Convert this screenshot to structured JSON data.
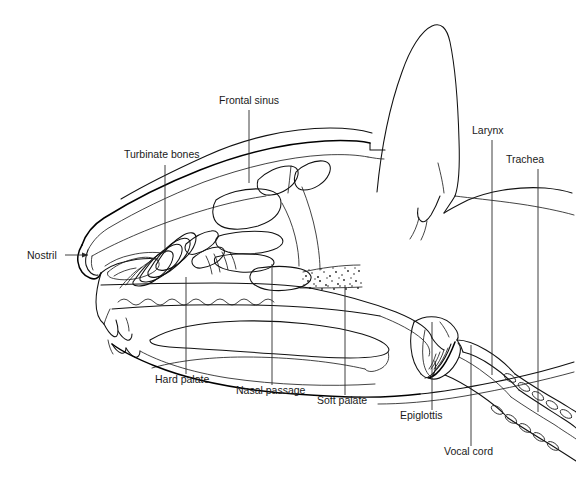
{
  "figure": {
    "type": "anatomical-line-diagram",
    "background_color": "#ffffff",
    "line_color": "#111111",
    "text_color": "#1a1a1a",
    "width": 576,
    "height": 484
  },
  "labels": [
    {
      "id": "frontal-sinus",
      "text": "Frontal sinus",
      "text_x": 219,
      "text_y": 104,
      "anchor": "start",
      "leader": {
        "type": "vertical",
        "x": 249,
        "y1": 110,
        "y2": 183
      }
    },
    {
      "id": "turbinate-bones",
      "text": "Turbinate bones",
      "text_x": 124,
      "text_y": 158,
      "anchor": "start",
      "leader": {
        "type": "vertical",
        "x": 165,
        "y1": 165,
        "y2": 253
      }
    },
    {
      "id": "larynx",
      "text": "Larynx",
      "text_x": 472,
      "text_y": 134,
      "anchor": "start",
      "leader": {
        "type": "vertical",
        "x": 492,
        "y1": 140,
        "y2": 375
      }
    },
    {
      "id": "trachea",
      "text": "Trachea",
      "text_x": 506,
      "text_y": 163,
      "anchor": "start",
      "leader": {
        "type": "vertical",
        "x": 538,
        "y1": 169,
        "y2": 412
      }
    },
    {
      "id": "nostril",
      "text": "Nostril",
      "text_x": 27,
      "text_y": 259,
      "anchor": "start",
      "leader": {
        "type": "arrow",
        "x1": 65,
        "y1": 255,
        "x2": 88,
        "y2": 255
      }
    },
    {
      "id": "hard-palate",
      "text": "Hard palate",
      "text_x": 155,
      "text_y": 383,
      "anchor": "start",
      "leader": {
        "type": "vertical",
        "x": 186,
        "y1": 277,
        "y2": 374
      }
    },
    {
      "id": "nasal-passage",
      "text": "Nasal passage",
      "text_x": 236,
      "text_y": 394,
      "anchor": "start",
      "leader": {
        "type": "vertical",
        "x": 272,
        "y1": 264,
        "y2": 385
      }
    },
    {
      "id": "soft-palate",
      "text": "Soft palate",
      "text_x": 317,
      "text_y": 404,
      "anchor": "start",
      "leader": {
        "type": "vertical",
        "x": 345,
        "y1": 285,
        "y2": 395
      }
    },
    {
      "id": "epiglottis",
      "text": "Epiglottis",
      "text_x": 400,
      "text_y": 419,
      "anchor": "start",
      "leader": {
        "type": "vertical",
        "x": 432,
        "y1": 322,
        "y2": 410
      }
    },
    {
      "id": "vocal-cord",
      "text": "Vocal cord",
      "text_x": 444,
      "text_y": 455,
      "anchor": "start",
      "leader": {
        "type": "vertical",
        "x": 471,
        "y1": 345,
        "y2": 446
      }
    }
  ],
  "structures": [
    {
      "id": "ear-pinna",
      "name": "Ear pinna"
    },
    {
      "id": "skull-dorsal-outline",
      "name": "Dorsal skull outline"
    },
    {
      "id": "frontal-sinus-cavity",
      "name": "Frontal sinus cavity"
    },
    {
      "id": "cranial-cavity",
      "name": "Cranial cavity"
    },
    {
      "id": "turbinate-scrolls",
      "name": "Nasal turbinate scrolls"
    },
    {
      "id": "nostril-opening",
      "name": "Nostril opening"
    },
    {
      "id": "hard-palate-rugae",
      "name": "Hard palate with rugae"
    },
    {
      "id": "tongue",
      "name": "Tongue"
    },
    {
      "id": "mandible",
      "name": "Mandible"
    },
    {
      "id": "soft-palate-structure",
      "name": "Soft palate"
    },
    {
      "id": "epiglottis-structure",
      "name": "Epiglottis"
    },
    {
      "id": "vocal-cord-structure",
      "name": "Vocal cord"
    },
    {
      "id": "larynx-structure",
      "name": "Larynx"
    },
    {
      "id": "trachea-rings",
      "name": "Trachea with cartilage rings"
    },
    {
      "id": "stippled-tissue",
      "name": "Stippled soft tissue region"
    }
  ]
}
